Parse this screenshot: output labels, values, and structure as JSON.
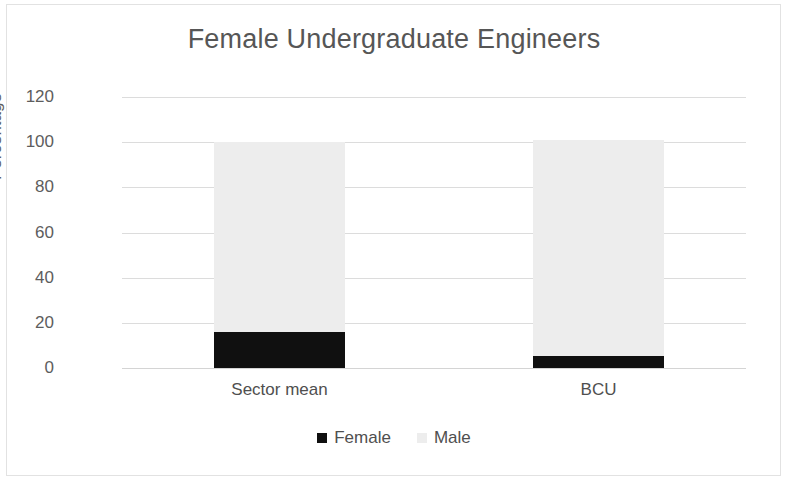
{
  "figure": {
    "background": "#ffffff",
    "border_color": "#e2e2e2"
  },
  "chart_data": {
    "type": "bar",
    "subtype": "stacked-column-100",
    "title": "Female Undergraduate Engineers",
    "subtitle": "",
    "xlabel": "",
    "ylabel": "Percentage",
    "categories": [
      "Sector mean",
      "BCU"
    ],
    "series": [
      {
        "name": "Female",
        "values": [
          16,
          5.5
        ],
        "color": "#101010"
      },
      {
        "name": "Male",
        "values": [
          84,
          95.5
        ],
        "color": "#ededed"
      }
    ],
    "stack_totals": [
      100,
      101
    ],
    "ylim": [
      0,
      120
    ],
    "yticks": [
      0,
      20,
      40,
      60,
      80,
      100,
      120
    ],
    "ytick_labels": [
      "0",
      "20",
      "40",
      "60",
      "80",
      "100",
      "120"
    ],
    "grid": true,
    "grid_axis": "y",
    "grid_color": "#dcdcdc",
    "legend": [
      "Female",
      "Male"
    ],
    "legend_position": "bottom",
    "annotations": []
  },
  "title": {
    "text": "Female Undergraduate Engineers"
  },
  "axes": {
    "y": {
      "label": "Percentage",
      "ticks": [
        {
          "value": 120,
          "label": "120"
        },
        {
          "value": 100,
          "label": "100"
        },
        {
          "value": 80,
          "label": "80"
        },
        {
          "value": 60,
          "label": "60"
        },
        {
          "value": 40,
          "label": "40"
        },
        {
          "value": 20,
          "label": "20"
        },
        {
          "value": 0,
          "label": "0"
        }
      ]
    },
    "x": {
      "ticks": [
        {
          "label": "Sector mean"
        },
        {
          "label": "BCU"
        }
      ]
    }
  },
  "legend": {
    "items": [
      {
        "label": "Female",
        "color": "#101010"
      },
      {
        "label": "Male",
        "color": "#ededed"
      }
    ]
  }
}
